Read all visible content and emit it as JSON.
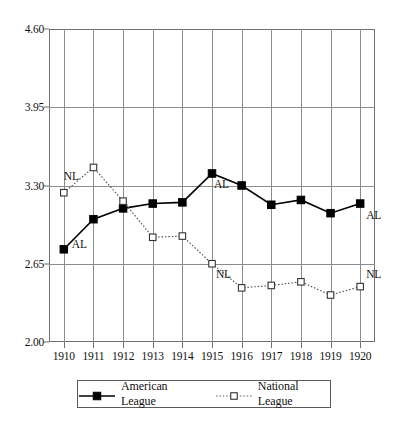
{
  "chart_data": {
    "type": "line",
    "title": "",
    "subtitle": "",
    "xlabel": "",
    "ylabel": "",
    "x": [
      1910,
      1911,
      1912,
      1913,
      1914,
      1915,
      1916,
      1917,
      1918,
      1919,
      1920
    ],
    "categories": [
      "1910",
      "1911",
      "1912",
      "1913",
      "1914",
      "1915",
      "1916",
      "1917",
      "1918",
      "1919",
      "1920"
    ],
    "xlim": [
      1909.5,
      1920.5
    ],
    "ylim": [
      2.0,
      4.6
    ],
    "yticks": [
      2.0,
      2.65,
      3.3,
      3.95,
      4.6
    ],
    "ytick_labels": [
      "2.00",
      "2.65",
      "3.30",
      "3.95",
      "4.60"
    ],
    "grid": true,
    "legend_position": "bottom",
    "series": [
      {
        "name": "American League",
        "key": "AL",
        "marker": "filled-square",
        "line_style": "solid",
        "color": "#000000",
        "values": [
          2.77,
          3.02,
          3.11,
          3.15,
          3.16,
          3.4,
          3.3,
          3.14,
          3.18,
          3.07,
          3.15
        ]
      },
      {
        "name": "National League",
        "key": "NL",
        "marker": "open-square",
        "line_style": "dotted",
        "color": "#555555",
        "values": [
          3.24,
          3.45,
          3.17,
          2.87,
          2.88,
          2.65,
          2.45,
          2.47,
          2.5,
          2.39,
          2.46
        ]
      }
    ],
    "annotations": [
      {
        "text": "NL",
        "x": 1910,
        "y": 3.24,
        "dx": 0,
        "dy": -16,
        "align": "left"
      },
      {
        "text": "AL",
        "x": 1910,
        "y": 2.77,
        "dx": 8,
        "dy": -4,
        "align": "left"
      },
      {
        "text": "AL",
        "x": 1915,
        "y": 3.4,
        "dx": 2,
        "dy": 12,
        "align": "left"
      },
      {
        "text": "NL",
        "x": 1915,
        "y": 2.65,
        "dx": 4,
        "dy": 11,
        "align": "left"
      },
      {
        "text": "AL",
        "x": 1920,
        "y": 3.15,
        "dx": 6,
        "dy": 12,
        "align": "left"
      },
      {
        "text": "NL",
        "x": 1920,
        "y": 2.46,
        "dx": 6,
        "dy": -12,
        "align": "left"
      }
    ]
  },
  "legend": {
    "entries": [
      {
        "label": "American League",
        "marker": "filled-square",
        "line_style": "solid"
      },
      {
        "label": "National League",
        "marker": "open-square",
        "line_style": "dotted"
      }
    ]
  }
}
